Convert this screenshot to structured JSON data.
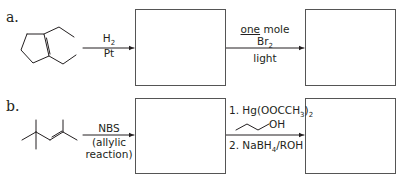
{
  "problems": [
    {
      "label": "a.",
      "starting_material": "1,2-diethylcyclopentene",
      "step1": {
        "line1_main": "H",
        "line1_sub": "2",
        "line2": "Pt"
      },
      "step2": {
        "line1_underlined": "one",
        "line1_rest": " mole",
        "line2_main": "Br",
        "line2_sub": "2",
        "line3": "light"
      },
      "answer_boxes": 2
    },
    {
      "label": "b.",
      "starting_material": "2,5,5-trimethyl-2-hexene",
      "step1": {
        "line1": "NBS",
        "line2": "(allylic",
        "line3": "reaction)"
      },
      "step2": {
        "line1_main": "1. Hg(OOCCH",
        "line1_sub1": "3",
        "line1_mid": ")",
        "line1_sub2": "2",
        "reagent_label": "OH",
        "line2_main": "2. NaBH",
        "line2_sub": "4",
        "line2_rest": "/ROH"
      },
      "answer_boxes": 2
    }
  ],
  "colors": {
    "ink": "#231f20",
    "box_border": "#555555"
  }
}
